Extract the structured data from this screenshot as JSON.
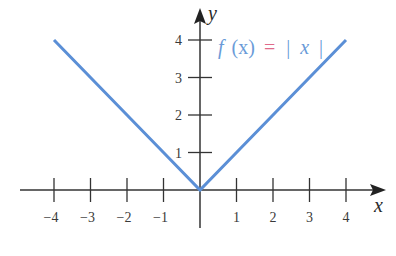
{
  "chart_data": {
    "type": "line",
    "title": "",
    "xlabel": "x",
    "ylabel": "y",
    "xlim": [
      -4,
      4
    ],
    "ylim": [
      0,
      4
    ],
    "grid": false,
    "x_ticks": [
      -4,
      -3,
      -2,
      -1,
      1,
      2,
      3,
      4
    ],
    "x_tick_labels": [
      "−4",
      "−3",
      "−2",
      "−1",
      "1",
      "2",
      "3",
      "4"
    ],
    "y_ticks": [
      1,
      2,
      3,
      4
    ],
    "y_tick_labels": [
      "1",
      "2",
      "3",
      "4"
    ],
    "series": [
      {
        "name": "f(x) = |x|",
        "x": [
          -4,
          -3,
          -2,
          -1,
          0,
          1,
          2,
          3,
          4
        ],
        "y": [
          4,
          3,
          2,
          1,
          0,
          1,
          2,
          3,
          4
        ],
        "color": "#5b8fd6"
      }
    ],
    "annotations": [
      {
        "text": "f (x) = | x |",
        "x": 0.5,
        "y": 3.7,
        "color": "#6a9bd8",
        "equals_color": "#e06a8a"
      }
    ]
  },
  "labels": {
    "x_axis": "x",
    "y_axis": "y",
    "func_f": "f",
    "func_arg": "(x)",
    "func_eq": "=",
    "func_bar_l": "|",
    "func_x": "x",
    "func_bar_r": "|"
  },
  "colors": {
    "line": "#5b8fd6",
    "axis": "#333333",
    "label_blue": "#6a9bd8",
    "equals_pink": "#e06a8a"
  }
}
